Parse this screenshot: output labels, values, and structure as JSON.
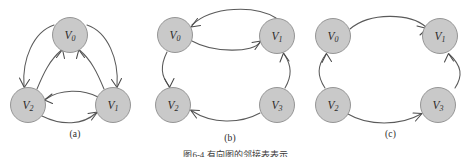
{
  "figure": {
    "caption": "图6-4  有向图的邻接表表示",
    "background_color": "#ffffff",
    "node_fill_color": "#c9c9c9",
    "node_stroke_color": "#8c8c8c",
    "edge_color": "#5a5a5a",
    "label_color": "#2b2b2b"
  },
  "panels": [
    {
      "id": "a",
      "subcaption": "(a)",
      "nodes": [
        {
          "id": "V0",
          "label_main": "V",
          "label_sub": "0",
          "cx": 70,
          "cy": 35,
          "r": 17.5
        },
        {
          "id": "V2",
          "label_main": "V",
          "label_sub": "2",
          "cx": 28,
          "cy": 105,
          "r": 17.5
        },
        {
          "id": "V1",
          "label_main": "V",
          "label_sub": "1",
          "cx": 113,
          "cy": 105,
          "r": 17.5
        }
      ],
      "edges": [
        {
          "from": "V0",
          "to": "V2",
          "curve": "outer-left"
        },
        {
          "from": "V2",
          "to": "V0",
          "curve": "inner-left"
        },
        {
          "from": "V0",
          "to": "V1",
          "curve": "outer-right"
        },
        {
          "from": "V1",
          "to": "V0",
          "curve": "inner-right"
        },
        {
          "from": "V2",
          "to": "V1",
          "curve": "lower-bottom"
        },
        {
          "from": "V1",
          "to": "V2",
          "curve": "upper-bottom"
        }
      ]
    },
    {
      "id": "b",
      "subcaption": "(b)",
      "nodes": [
        {
          "id": "V0",
          "label_main": "V",
          "label_sub": "0",
          "cx": 25,
          "cy": 35,
          "r": 17.5
        },
        {
          "id": "V1",
          "label_main": "V",
          "label_sub": "1",
          "cx": 127,
          "cy": 36,
          "r": 17.5
        },
        {
          "id": "V2",
          "label_main": "V",
          "label_sub": "2",
          "cx": 23,
          "cy": 105,
          "r": 17.5
        },
        {
          "id": "V3",
          "label_main": "V",
          "label_sub": "3",
          "cx": 127,
          "cy": 105,
          "r": 17.5
        }
      ],
      "edges": [
        {
          "from": "V1",
          "to": "V0",
          "curve": "top-outer"
        },
        {
          "from": "V0",
          "to": "V1",
          "curve": "top-inner"
        },
        {
          "from": "V0",
          "to": "V2",
          "curve": "left-side"
        },
        {
          "from": "V3",
          "to": "V2",
          "curve": "bottom"
        },
        {
          "from": "V3",
          "to": "V1",
          "curve": "right-side"
        }
      ]
    },
    {
      "id": "c",
      "subcaption": "(c)",
      "nodes": [
        {
          "id": "V0",
          "label_main": "V",
          "label_sub": "0",
          "cx": 23,
          "cy": 36,
          "r": 17.5
        },
        {
          "id": "V1",
          "label_main": "V",
          "label_sub": "1",
          "cx": 130,
          "cy": 36,
          "r": 17.5
        },
        {
          "id": "V2",
          "label_main": "V",
          "label_sub": "2",
          "cx": 23,
          "cy": 105,
          "r": 17.5
        },
        {
          "id": "V3",
          "label_main": "V",
          "label_sub": "3",
          "cx": 128,
          "cy": 105,
          "r": 17.5
        }
      ],
      "edges": [
        {
          "from": "V0",
          "to": "V1",
          "curve": "top"
        },
        {
          "from": "V2",
          "to": "V0",
          "curve": "left-side"
        },
        {
          "from": "V2",
          "to": "V3",
          "curve": "bottom"
        },
        {
          "from": "V3",
          "to": "V1",
          "curve": "right-side"
        }
      ]
    }
  ]
}
